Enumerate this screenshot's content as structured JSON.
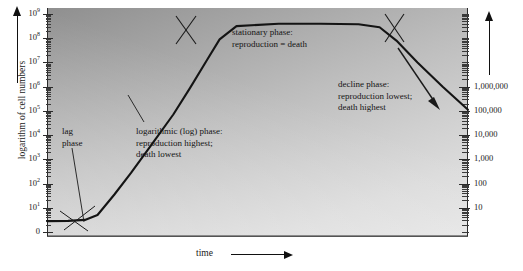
{
  "figure": {
    "type": "bacterial-growth-curve",
    "x_axis": {
      "title": "time",
      "arrow": "right-arrow"
    },
    "y_axis_left": {
      "title": "logarithm of cell numbers",
      "arrow": "up-arrow",
      "ticks": [
        "10^9",
        "10^8",
        "10^7",
        "10^6",
        "10^5",
        "10^4",
        "10^3",
        "10^2",
        "10^1",
        "0"
      ],
      "tick_labels": [
        "10",
        "10",
        "10",
        "10",
        "10",
        "10",
        "10",
        "10",
        "10",
        "0"
      ],
      "exponents": [
        "9",
        "8",
        "7",
        "6",
        "5",
        "4",
        "3",
        "2",
        "1",
        ""
      ]
    },
    "y_axis_right": {
      "arrow": "up-arrow",
      "ticks": [
        "1,000,000",
        "100,000",
        "10,000",
        "1,000",
        "100",
        "10"
      ]
    },
    "annotations": [
      {
        "name": "lag-phase",
        "lines": [
          "lag",
          "phase"
        ]
      },
      {
        "name": "log-phase",
        "lines": [
          "logarithmic (log) phase:",
          "reproduction highest;",
          "death lowest"
        ]
      },
      {
        "name": "stationary-phase",
        "lines": [
          "stationary phase:",
          "reproduction = death"
        ]
      },
      {
        "name": "decline-phase",
        "lines": [
          "decline phase:",
          "reproduction lowest;",
          "death highest"
        ]
      }
    ]
  },
  "chart_data": {
    "type": "line",
    "title": "",
    "xlabel": "time",
    "ylabel": "logarithm of cell numbers",
    "scale": "log",
    "ylim": [
      0,
      1000000000
    ],
    "left_tick_values": [
      1000000000,
      100000000,
      10000000,
      1000000,
      100000,
      10000,
      1000,
      100,
      10,
      0
    ],
    "left_tick_labels": [
      "10⁹",
      "10⁸",
      "10⁷",
      "10⁶",
      "10⁵",
      "10⁴",
      "10³",
      "10²",
      "10¹",
      "0"
    ],
    "right_tick_labels": [
      "1,000,000",
      "100,000",
      "10,000",
      "1,000",
      "100",
      "10"
    ],
    "grid": false,
    "legend": "none",
    "phases": [
      {
        "name": "lag phase",
        "x_start": 0,
        "x_end": 0.1,
        "log_y_start": 0.45,
        "log_y_end": 0.55
      },
      {
        "name": "logarithmic (log) phase",
        "x_start": 0.1,
        "x_end": 0.4,
        "log_y_start": 0.55,
        "log_y_end": 8.55
      },
      {
        "name": "stationary phase",
        "x_start": 0.4,
        "x_end": 0.78,
        "log_y_start": 8.55,
        "log_y_end": 8.6
      },
      {
        "name": "decline phase",
        "x_start": 0.78,
        "x_end": 1.0,
        "log_y_start": 8.6,
        "log_y_end": 5.0
      }
    ],
    "series": [
      {
        "name": "cell numbers",
        "x": [
          0.0,
          0.05,
          0.09,
          0.12,
          0.16,
          0.2,
          0.25,
          0.3,
          0.34,
          0.38,
          0.41,
          0.45,
          0.55,
          0.65,
          0.74,
          0.79,
          0.83,
          0.88,
          0.94,
          1.0
        ],
        "log_y": [
          0.45,
          0.46,
          0.5,
          0.7,
          1.55,
          2.45,
          3.65,
          4.85,
          5.95,
          7.1,
          7.95,
          8.5,
          8.6,
          8.6,
          8.58,
          8.45,
          7.9,
          7.0,
          6.0,
          5.05
        ]
      }
    ]
  },
  "colors": {
    "curve": "#141414",
    "axis": "#2b2b2b",
    "text": "#141414",
    "panel_dark": "#8f8f8f",
    "panel_light": "#e6e6e6"
  }
}
